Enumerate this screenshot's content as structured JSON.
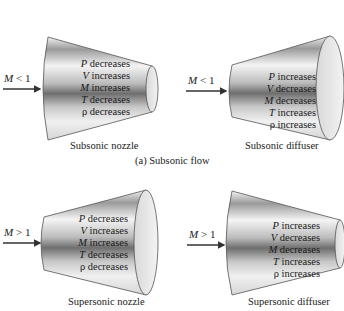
{
  "figure": {
    "subsonic_caption": "(a) Subsonic flow",
    "panels": [
      {
        "id": "subsonic-nozzle",
        "title": "Subsonic nozzle",
        "mach_label": "M < 1",
        "mach_symbol": "M",
        "mach_relation": "< 1",
        "shape": "converging",
        "properties": [
          {
            "symbol": "P",
            "change": "decreases"
          },
          {
            "symbol": "V",
            "change": "increases"
          },
          {
            "symbol": "M",
            "change": "increases"
          },
          {
            "symbol": "T",
            "change": "decreases"
          },
          {
            "symbol": "ρ",
            "change": "decreases"
          }
        ]
      },
      {
        "id": "subsonic-diffuser",
        "title": "Subsonic diffuser",
        "mach_label": "M < 1",
        "mach_symbol": "M",
        "mach_relation": "< 1",
        "shape": "diverging",
        "properties": [
          {
            "symbol": "P",
            "change": "increases"
          },
          {
            "symbol": "V",
            "change": "decreases"
          },
          {
            "symbol": "M",
            "change": "decreases"
          },
          {
            "symbol": "T",
            "change": "increases"
          },
          {
            "symbol": "ρ",
            "change": "increases"
          }
        ]
      },
      {
        "id": "supersonic-nozzle",
        "title": "Supersonic nozzle",
        "mach_label": "M > 1",
        "mach_symbol": "M",
        "mach_relation": "> 1",
        "shape": "diverging",
        "properties": [
          {
            "symbol": "P",
            "change": "decreases"
          },
          {
            "symbol": "V",
            "change": "increases"
          },
          {
            "symbol": "M",
            "change": "increases"
          },
          {
            "symbol": "T",
            "change": "decreases"
          },
          {
            "symbol": "ρ",
            "change": "decreases"
          }
        ]
      },
      {
        "id": "supersonic-diffuser",
        "title": "Supersonic diffuser",
        "mach_label": "M > 1",
        "mach_symbol": "M",
        "mach_relation": "> 1",
        "shape": "converging",
        "properties": [
          {
            "symbol": "P",
            "change": "increases"
          },
          {
            "symbol": "V",
            "change": "decreases"
          },
          {
            "symbol": "M",
            "change": "decreases"
          },
          {
            "symbol": "T",
            "change": "increases"
          },
          {
            "symbol": "ρ",
            "change": "increases"
          }
        ]
      }
    ]
  }
}
